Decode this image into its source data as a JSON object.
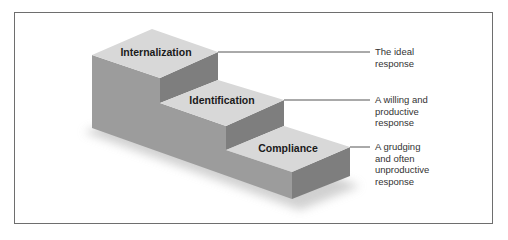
{
  "diagram": {
    "type": "staircase",
    "steps": [
      {
        "label": "Internalization",
        "level": 3,
        "description_lines": [
          "The ideal",
          "response"
        ]
      },
      {
        "label": "Identification",
        "level": 2,
        "description_lines": [
          "A willing and",
          "productive",
          "response"
        ]
      },
      {
        "label": "Compliance",
        "level": 1,
        "description_lines": [
          "A grudging",
          "and often",
          "unproductive",
          "response"
        ]
      }
    ],
    "colors": {
      "top_face": "#d8d8d8",
      "front_face": "#9c9c9c",
      "side_face": "#7e7e7e",
      "leader_line": "#555555",
      "frame": "#6e6e6e"
    }
  }
}
